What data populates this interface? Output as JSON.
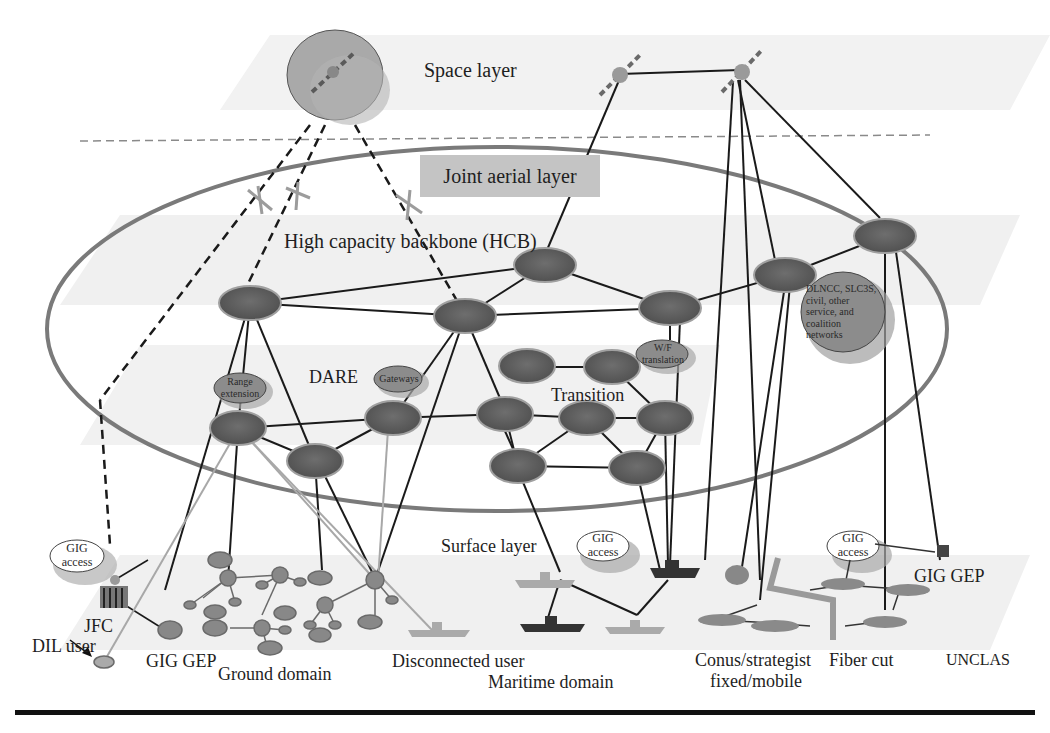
{
  "diagram": {
    "layers": {
      "space": "Space layer",
      "joint_aerial": "Joint aerial layer",
      "hcb": "High capacity backbone (HCB)",
      "surface": "Surface layer"
    },
    "regions": {
      "dare": "DARE",
      "transition": "Transition"
    },
    "clouds": {
      "range_extension": [
        "Range",
        "extension"
      ],
      "gateways": "Gateways",
      "wf_translation": [
        "W/F",
        "translation"
      ],
      "dlncc": [
        "DLNCC, SLC3S,",
        "civil, other",
        "service, and",
        "coalition",
        "networks"
      ],
      "gig_access_left": [
        "GIG",
        "access"
      ],
      "gig_access_mid": [
        "GIG",
        "access"
      ],
      "gig_access_right": [
        "GIG",
        "access"
      ]
    },
    "bottom_labels": {
      "jfc": "JFC",
      "dil_user": "DIL user",
      "gig_gep_left": "GIG GEP",
      "ground_domain": "Ground domain",
      "disconnected_user": "Disconnected user",
      "maritime_domain": "Maritime domain",
      "conus": "Conus/strategist",
      "conus_line2": "fixed/mobile",
      "fiber_cut": "Fiber cut",
      "unclas": "UNCLAS",
      "gig_gep_right": "GIG GEP"
    },
    "colors": {
      "node_fill": "#5e5e5e",
      "node_stroke": "#9a9a9a",
      "ellipse_stroke": "#7a7a7a",
      "cloud_fill": "#8c8c8c",
      "band_fill": "#efefef",
      "aerial_box": "#c4c4c4",
      "link": "#1a1a1a"
    }
  }
}
